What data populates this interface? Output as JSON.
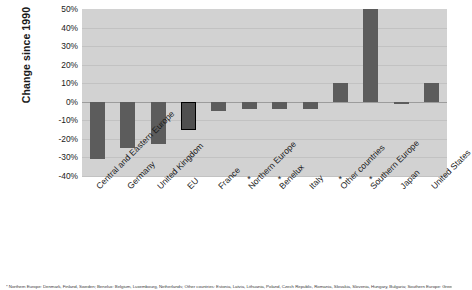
{
  "chart_data": {
    "type": "bar",
    "title": "",
    "ylabel": "Change since 1990",
    "xlabel": "",
    "ylim": [
      -40,
      50
    ],
    "ytick_values": [
      50,
      40,
      30,
      20,
      10,
      0,
      -10,
      -20,
      -30,
      -40
    ],
    "ytick_labels": [
      "50%",
      "40%",
      "30%",
      "20%",
      "10%",
      "0%",
      "-10%",
      "-20%",
      "-30%",
      "-40%"
    ],
    "grid": true,
    "legend": "none",
    "categories": [
      "Central and Eastern Europe",
      "Germany",
      "United Kingdom",
      "EU",
      "France",
      "Northern Europe",
      "Benelux",
      "Italy",
      "Other countries",
      "Southern Europe",
      "Japan",
      "United States"
    ],
    "category_markers": [
      "",
      "",
      "",
      "",
      "",
      "*",
      "*",
      "",
      "*",
      "*",
      "",
      ""
    ],
    "values": [
      -31,
      -25,
      -23,
      -15,
      -5,
      -4,
      -4,
      -4,
      10,
      50,
      -1,
      10
    ],
    "highlighted_category": "EU",
    "bar_color": "#5c5c5c",
    "highlight_outline_color": "#000000",
    "plot_background": "#d2d2d2"
  },
  "footnote": "* Northern Europe: Denmark, Finland, Sweden; Benelux: Belgium, Luxembourg, Netherlands; Other countries: Estonia, Latvia, Lithuania, Poland, Czech Republic, Romania, Slovakia, Slovenia, Hungary, Bulgaria; Southern Europe: Greece, Portugal, Spain, Malta, Cyprus"
}
